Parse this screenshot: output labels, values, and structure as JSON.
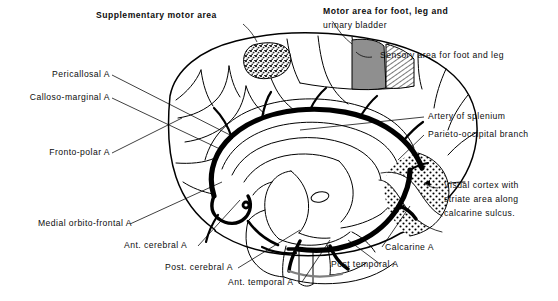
{
  "figure": {
    "background_color": "#ffffff",
    "ink_color": "#000000"
  },
  "labels": {
    "supplementary_motor_area": "Supplementary motor area",
    "motor_area_line1": "Motor area for foot, leg and",
    "motor_area_line2": "urinary bladder",
    "sensory_area": "Sensory area for foot and leg",
    "pericallosal": "Pericallosal A",
    "calloso_marginal": "Calloso-marginal A",
    "fronto_polar": "Fronto-polar A",
    "medial_orbito_frontal": "Medial orbito-frontal A",
    "ant_cerebral": "Ant. cerebral A",
    "post_cerebral": "Post. cerebral A",
    "ant_temporal": "Ant. temporal A",
    "post_temporal": "Post temporal A",
    "calcarine": "Calcarine A",
    "artery_of_splenium": "Artery of splenium",
    "parieto_occipital": "Parieto-occipital branch",
    "visual_cortex_line1": "Visual cortex with",
    "visual_cortex_line2": "striate area along",
    "visual_cortex_line3": "calcarine sulcus."
  },
  "regions": {
    "supplementary_motor": {
      "name": "Supplementary motor area",
      "pattern": "mottled-stipple",
      "color": "#6b6b6b"
    },
    "motor_foot_leg": {
      "name": "Motor area for foot, leg and urinary bladder",
      "pattern": "solid-gray",
      "color": "#8c8c8c"
    },
    "sensory_foot_leg": {
      "name": "Sensory area for foot and leg",
      "pattern": "diagonal-hatch",
      "color": "#000000"
    },
    "visual_cortex": {
      "name": "Visual cortex with striate area along calcarine sulcus",
      "pattern": "coarse-dot-stipple",
      "color": "#000000"
    }
  },
  "arteries": [
    "Pericallosal A",
    "Calloso-marginal A",
    "Fronto-polar A",
    "Medial orbito-frontal A",
    "Ant. cerebral A",
    "Post. cerebral A",
    "Ant. temporal A",
    "Post temporal A",
    "Calcarine A",
    "Artery of splenium",
    "Parieto-occipital branch"
  ]
}
